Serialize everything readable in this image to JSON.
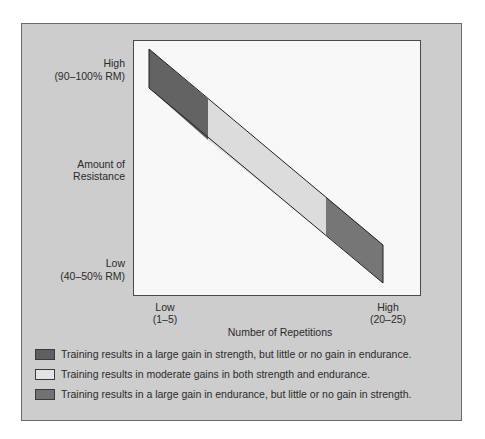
{
  "diagram": {
    "y_axis": {
      "title_line1": "Amount of",
      "title_line2": "Resistance",
      "high_label": "High",
      "high_sub": "(90–100% RM)",
      "low_label": "Low",
      "low_sub": "(40–50% RM)"
    },
    "x_axis": {
      "title": "Number of Repetitions",
      "low_label": "Low",
      "low_sub": "(1–5)",
      "high_label": "High",
      "high_sub": "(20–25)"
    },
    "band_segments": [
      {
        "name": "strength",
        "color": "#636363"
      },
      {
        "name": "moderate",
        "color": "#dcdcdc"
      },
      {
        "name": "endurance",
        "color": "#767676"
      }
    ],
    "legend": [
      {
        "color": "#5f5f5f",
        "text": "Training results in a large gain in strength, but little or no gain in endurance."
      },
      {
        "color": "#e3e3e3",
        "text": "Training results in moderate gains in both strength and endurance."
      },
      {
        "color": "#727272",
        "text": "Training results in a large gain in endurance, but little or no gain in strength."
      }
    ]
  }
}
